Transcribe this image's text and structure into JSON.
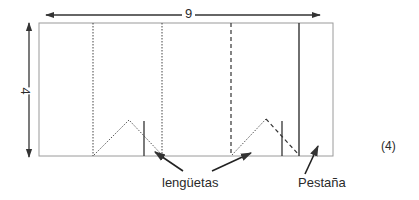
{
  "diagram": {
    "dimensions": {
      "width_label": "9",
      "height_label": "4"
    },
    "labels": {
      "tabs": "lengüetas",
      "flap": "Pestaña",
      "figure_number": "(4)"
    },
    "line_styles": {
      "outline": "#9a9a9a",
      "fold_dotted": "#444444",
      "fold_dashed": "#333333",
      "cut_solid": "#333333",
      "arrow": "#333333"
    }
  }
}
